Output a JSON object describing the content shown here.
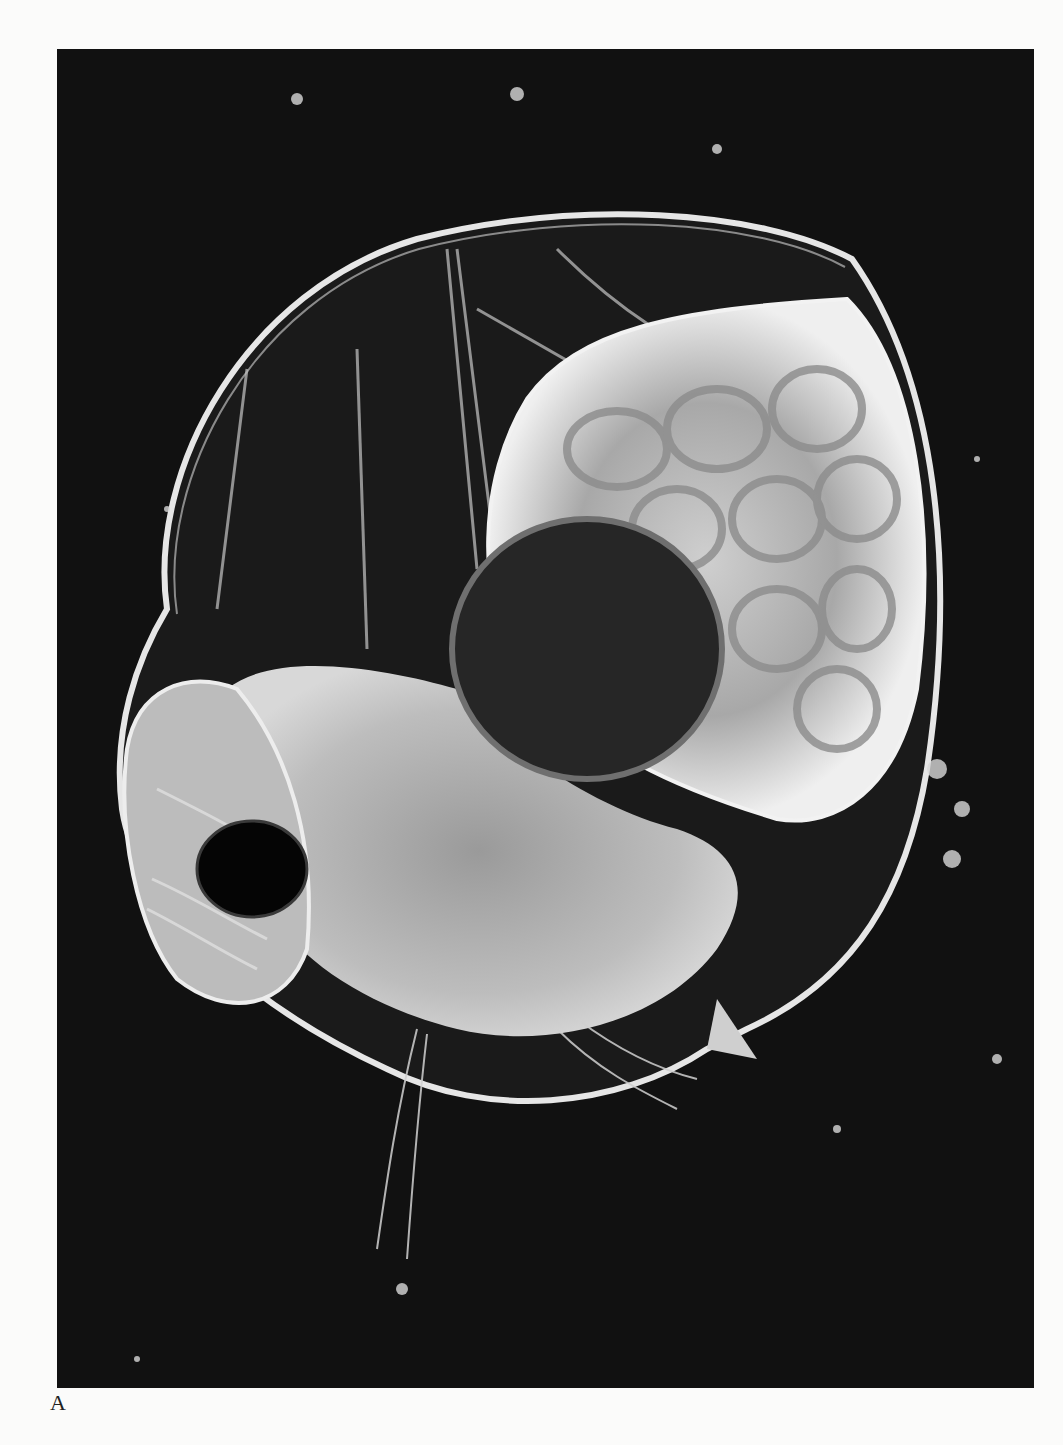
{
  "figure": {
    "panel_label": "A",
    "image_description": "Dark-field micrograph of a cladoceran crustacean (water flea) with transparent carapace, compound eye, brood chamber with eggs, and antennae",
    "colors": {
      "background_page": "#fbfbfa",
      "photo_background": "#111111",
      "specimen_highlight": "#e8e8e8"
    }
  }
}
